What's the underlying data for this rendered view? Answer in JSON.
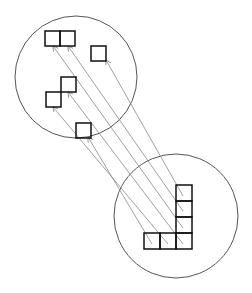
{
  "diagram": {
    "colors": {
      "background": "#ffffff",
      "circle": "#555555",
      "square": "#111111",
      "arrow": "#888888"
    },
    "circles": [
      {
        "id": "top",
        "cx": 76,
        "cy": 77,
        "r": 61
      },
      {
        "id": "bottom",
        "cx": 176,
        "cy": 216,
        "r": 62
      }
    ],
    "top_squares": [
      {
        "x": 45,
        "y": 31,
        "size": 15
      },
      {
        "x": 60,
        "y": 31,
        "size": 15
      },
      {
        "x": 91,
        "y": 46,
        "size": 15
      },
      {
        "x": 61,
        "y": 77,
        "size": 15
      },
      {
        "x": 46,
        "y": 92,
        "size": 15
      },
      {
        "x": 76,
        "y": 123,
        "size": 15
      }
    ],
    "bottom_squares": [
      {
        "x": 176,
        "y": 185,
        "size": 16
      },
      {
        "x": 176,
        "y": 201,
        "size": 16
      },
      {
        "x": 176,
        "y": 217,
        "size": 16
      },
      {
        "x": 176,
        "y": 233,
        "size": 16
      },
      {
        "x": 160,
        "y": 233,
        "size": 16
      },
      {
        "x": 144,
        "y": 233,
        "size": 16
      }
    ],
    "arrows": [
      {
        "from": [
          183,
          196
        ],
        "to": [
          106,
          60
        ]
      },
      {
        "from": [
          183,
          211
        ],
        "to": [
          68,
          46
        ]
      },
      {
        "from": [
          183,
          228
        ],
        "to": [
          53,
          46
        ]
      },
      {
        "from": [
          183,
          244
        ],
        "to": [
          68,
          92
        ]
      },
      {
        "from": [
          168,
          244
        ],
        "to": [
          53,
          107
        ]
      },
      {
        "from": [
          152,
          244
        ],
        "to": [
          88,
          137
        ]
      }
    ]
  }
}
